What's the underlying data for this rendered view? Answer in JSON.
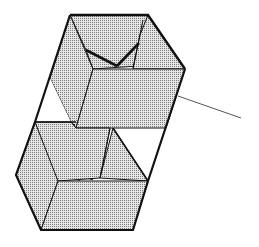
{
  "diagram": {
    "colors": {
      "background": "#ffffff",
      "frame": "#111111",
      "fabric_fill": "#d9d9d9",
      "fabric_dot": "#555555",
      "string": "#555555"
    },
    "parts": {
      "upper_cell": "upper-cell",
      "lower_cell": "lower-cell",
      "cross_spars": "cross-spars",
      "tether": "kite-string"
    }
  }
}
